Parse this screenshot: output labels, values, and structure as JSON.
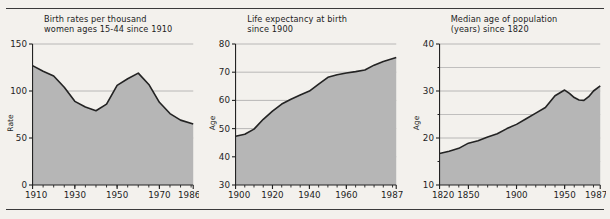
{
  "page": {
    "background_color": "#f3f1ed",
    "rule_color": "#3a3a3a",
    "area_fill_color": "#b6b6b6",
    "line_color": "#232323",
    "grid_color": "#a9a9a9"
  },
  "charts": [
    {
      "title_line1": "Birth rates per thousand",
      "title_line2": "women ages 15-44 since 1910",
      "ylabel": "Rate",
      "chart_data": {
        "type": "area",
        "title": "Birth rates per thousand women ages 15-44 since 1910",
        "xlabel": "",
        "ylabel": "Rate",
        "xlim": [
          1910,
          1986
        ],
        "ylim": [
          0,
          150
        ],
        "yticks": [
          0,
          50,
          100,
          150
        ],
        "xticks": [
          1910,
          1930,
          1950,
          1970,
          1986
        ],
        "grid": true,
        "x": [
          1910,
          1915,
          1920,
          1925,
          1930,
          1935,
          1940,
          1945,
          1950,
          1955,
          1960,
          1965,
          1970,
          1975,
          1980,
          1986
        ],
        "values": [
          127,
          121,
          116,
          104,
          89,
          83,
          79,
          86,
          106,
          113,
          119,
          107,
          88,
          76,
          69,
          65
        ]
      }
    },
    {
      "title_line1": "Life expectancy at birth",
      "title_line2": "since 1900",
      "ylabel": "Age",
      "chart_data": {
        "type": "area",
        "title": "Life expectancy at birth since 1900",
        "xlabel": "",
        "ylabel": "Age",
        "xlim": [
          1900,
          1987
        ],
        "ylim": [
          30,
          80
        ],
        "yticks": [
          30,
          40,
          50,
          60,
          70,
          80
        ],
        "xticks": [
          1900,
          1920,
          1940,
          1960,
          1987
        ],
        "grid": true,
        "x": [
          1900,
          1905,
          1910,
          1915,
          1920,
          1925,
          1930,
          1935,
          1940,
          1945,
          1950,
          1955,
          1960,
          1965,
          1970,
          1975,
          1980,
          1987
        ],
        "values": [
          47.3,
          48.0,
          49.8,
          53.3,
          56.2,
          58.7,
          60.4,
          61.9,
          63.3,
          65.8,
          68.2,
          69.1,
          69.7,
          70.2,
          70.8,
          72.5,
          73.8,
          75.2
        ]
      }
    },
    {
      "title_line1": "Median age of population",
      "title_line2": "(years) since 1820",
      "ylabel": "Age",
      "chart_data": {
        "type": "area",
        "title": "Median age of population (years) since 1820",
        "xlabel": "",
        "ylabel": "Age",
        "xlim": [
          1820,
          1987
        ],
        "ylim": [
          10,
          40
        ],
        "yticks": [
          10,
          20,
          30,
          40
        ],
        "yminorticks": [
          15,
          25,
          35
        ],
        "xticks": [
          1820,
          1850,
          1900,
          1950,
          1987
        ],
        "grid": true,
        "x": [
          1820,
          1830,
          1840,
          1850,
          1860,
          1870,
          1880,
          1890,
          1900,
          1910,
          1920,
          1930,
          1940,
          1950,
          1955,
          1960,
          1965,
          1970,
          1975,
          1980,
          1987
        ],
        "values": [
          16.7,
          17.2,
          17.8,
          18.9,
          19.4,
          20.2,
          20.9,
          22.0,
          22.9,
          24.1,
          25.3,
          26.5,
          29.0,
          30.2,
          29.5,
          28.6,
          28.1,
          28.0,
          28.8,
          30.0,
          31.1
        ]
      }
    }
  ]
}
